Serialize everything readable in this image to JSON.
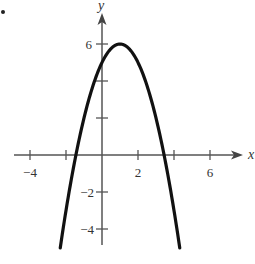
{
  "chart_data": {
    "type": "line",
    "title": "",
    "xlabel": "x",
    "ylabel": "y",
    "xlim": [
      -4.6,
      7.3
    ],
    "ylim": [
      -5.0,
      7.0
    ],
    "grid": false,
    "x_ticks": [
      -4,
      -2,
      2,
      4,
      6
    ],
    "x_tick_labels": [
      "-4",
      "",
      "2",
      "",
      "6"
    ],
    "y_ticks": [
      -4,
      -2,
      2,
      4,
      6
    ],
    "y_tick_labels": [
      "-4",
      "-2",
      "",
      "",
      "6"
    ],
    "series": [
      {
        "name": "f(x) = -(x - 1)^2 + 6",
        "vertex": [
          1,
          6
        ],
        "y_intercept": 5,
        "x_intercepts": [
          -1.45,
          3.45
        ],
        "x": [
          -2.32,
          -2,
          -1.5,
          -1,
          -0.5,
          0,
          0.5,
          1,
          1.5,
          2,
          2.5,
          3,
          3.5,
          4,
          4.32
        ],
        "values": [
          -5.0,
          -3.0,
          -0.25,
          2.0,
          3.75,
          5.0,
          5.75,
          6.0,
          5.75,
          5.0,
          3.75,
          2.0,
          -0.25,
          -3.0,
          -5.0
        ]
      }
    ]
  },
  "labels": {
    "x_axis": "x",
    "y_axis": "y",
    "tick_x_neg4": "−4",
    "tick_x_2": "2",
    "tick_x_6": "6",
    "tick_y_6": "6",
    "tick_y_neg2": "−2",
    "tick_y_neg4": "−4"
  },
  "colors": {
    "axis": "#555555",
    "curve": "#111111"
  }
}
